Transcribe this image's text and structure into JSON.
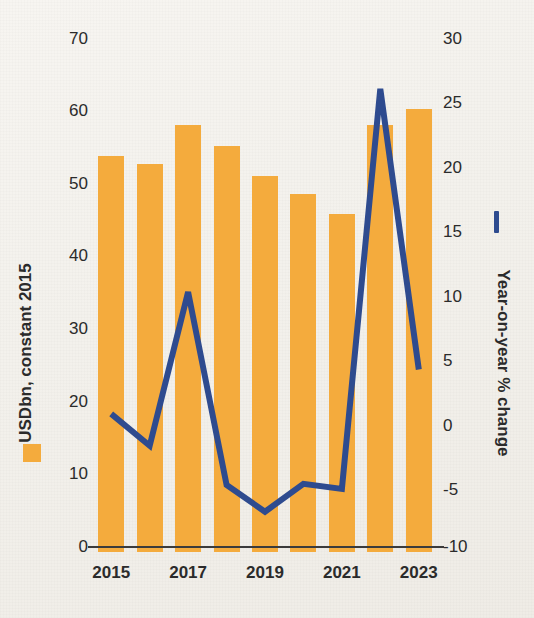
{
  "chart_data": {
    "type": "bar",
    "title": "",
    "subtitle": "",
    "categories": [
      "2015",
      "2016",
      "2017",
      "2018",
      "2019",
      "2020",
      "2021",
      "2022",
      "2023"
    ],
    "xlabel": "",
    "grid": false,
    "legend_position": "axis-titles",
    "series": [
      {
        "name": "USDbn, constant 2015",
        "type": "bar",
        "axis": "left",
        "color": "#f4ab3d",
        "values": [
          54.6,
          53.5,
          58.8,
          55.9,
          51.8,
          49.3,
          46.6,
          58.8,
          61.0
        ]
      },
      {
        "name": "Year-on-year % change",
        "type": "line",
        "axis": "right",
        "color": "#2e4b8f",
        "values": [
          0.4,
          -2.1,
          10.0,
          -5.2,
          -7.3,
          -5.1,
          -5.5,
          26.0,
          3.9
        ]
      }
    ],
    "left_axis": {
      "label": "USDbn, constant 2015",
      "ticks": [
        0,
        10,
        20,
        30,
        40,
        50,
        60,
        70
      ],
      "ylim": [
        0,
        70
      ]
    },
    "right_axis": {
      "label": "Year-on-year % change",
      "ticks": [
        -10,
        -5,
        0,
        5,
        10,
        15,
        20,
        25,
        30
      ],
      "ylim": [
        -10,
        30
      ]
    },
    "x_tick_labels": [
      "2015",
      "2017",
      "2019",
      "2021",
      "2023"
    ]
  },
  "axes": {
    "left": {
      "title": "USDbn, constant 2015",
      "tick_labels": [
        "70",
        "60",
        "50",
        "40",
        "30",
        "20",
        "10",
        "0"
      ]
    },
    "right": {
      "title": "Year-on-year % change",
      "tick_labels": [
        "30",
        "25",
        "20",
        "15",
        "10",
        "5",
        "0",
        "-5",
        "-10"
      ]
    },
    "x": {
      "tick_labels": [
        "2015",
        "2017",
        "2019",
        "2021",
        "2023"
      ]
    }
  },
  "colors": {
    "bar": "#f4ab3d",
    "line": "#2e4b8f",
    "text": "#2b2b2b",
    "background": "#f4f2ee",
    "axis": "#3b3b3b"
  }
}
